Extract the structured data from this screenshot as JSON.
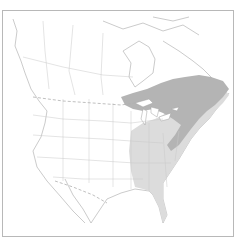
{
  "map": {
    "region": "North America",
    "style": "grayscale outline range map",
    "colors": {
      "background": "#ffffff",
      "frame": "#b8b8b8",
      "boundaries": "#c8c8c8",
      "coast": "#a0a0a0",
      "range_light": "#dcdcdc",
      "range_dark": "#b4b4b4",
      "lakes": "#ffffff"
    },
    "legend": [],
    "layers": [
      {
        "name": "range-light",
        "description": "Eastern United States from Mississippi valley to Atlantic coast including Florida"
      },
      {
        "name": "range-dark",
        "description": "Southern Canada (Ontario/Quebec), Great Lakes, New England, Maritimes and Appalachian ridge"
      }
    ]
  }
}
